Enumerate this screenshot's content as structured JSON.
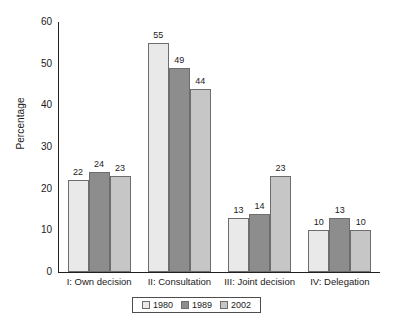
{
  "chart_data": {
    "type": "bar",
    "title": "",
    "xlabel": "",
    "ylabel": "Percentage",
    "ylim": [
      0,
      60
    ],
    "yticks": [
      0,
      10,
      20,
      30,
      40,
      50,
      60
    ],
    "grid": false,
    "legend_position": "bottom",
    "categories": [
      "I: Own decision",
      "II: Consultation",
      "III: Joint decision",
      "IV: Delegation"
    ],
    "series": [
      {
        "name": "1980",
        "color": "#e9e9e9",
        "values": [
          22,
          55,
          13,
          10
        ]
      },
      {
        "name": "1989",
        "color": "#8d8d8d",
        "values": [
          24,
          49,
          14,
          13
        ]
      },
      {
        "name": "2002",
        "color": "#c6c6c6",
        "values": [
          23,
          44,
          23,
          10
        ]
      }
    ],
    "value_labels": [
      [
        "22",
        "24",
        "23"
      ],
      [
        "55",
        "49",
        "44"
      ],
      [
        "13",
        "14",
        "23"
      ],
      [
        "10",
        "13",
        "10"
      ]
    ],
    "axis_color": "#1f1f1f",
    "bar_border_color": "#6d6d6d"
  }
}
